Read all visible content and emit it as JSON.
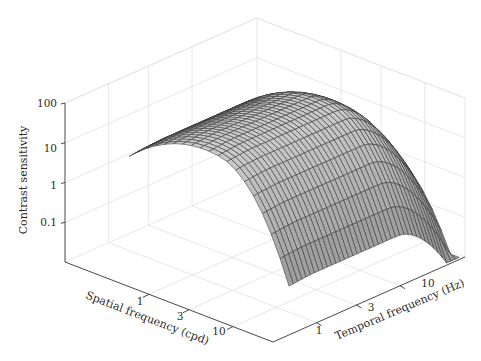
{
  "chart_data": {
    "type": "surface3d",
    "title": "",
    "xlabel": "Spatial frequency (cpd)",
    "ylabel": "Temporal frequency (Hz)",
    "zlabel": "Contrast sensitivity",
    "x_ticks": [
      {
        "value": 1,
        "label": "1"
      },
      {
        "value": 3,
        "label": "3"
      },
      {
        "value": 10,
        "label": "10"
      }
    ],
    "y_ticks": [
      {
        "value": 1,
        "label": "1"
      },
      {
        "value": 3,
        "label": "3"
      },
      {
        "value": 10,
        "label": "10"
      }
    ],
    "z_ticks": [
      {
        "value": 0.1,
        "label": "0.1"
      },
      {
        "value": 1,
        "label": "1"
      },
      {
        "value": 10,
        "label": "10"
      },
      {
        "value": 100,
        "label": "100"
      }
    ],
    "x_scale": "log",
    "y_scale": "log",
    "z_scale": "log",
    "xlim": [
      0.1,
      30
    ],
    "ylim": [
      0.3,
      60
    ],
    "zlim": [
      0.01,
      100
    ],
    "grid": true,
    "surface_color": "#bdbdbd",
    "edge_color": "#333333"
  },
  "axes": {
    "z_label": "Contrast sensitivity",
    "x_label": "Spatial frequency (cpd)",
    "y_label": "Temporal frequency (Hz)",
    "z_tick_labels": [
      "100",
      "10",
      "1",
      "0.1"
    ],
    "x_tick_labels": [
      "1",
      "3",
      "10"
    ],
    "y_tick_labels": [
      "1",
      "3",
      "10"
    ]
  }
}
